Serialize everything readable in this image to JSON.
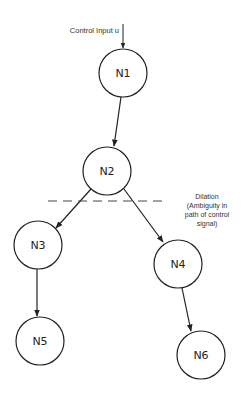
{
  "diagram": {
    "input_label": "Control Input u",
    "nodes": [
      {
        "id": "N1",
        "label": "N1",
        "cx": 123,
        "cy": 73
      },
      {
        "id": "N2",
        "label": "N2",
        "cx": 107,
        "cy": 171
      },
      {
        "id": "N3",
        "label": "N3",
        "cx": 38,
        "cy": 245
      },
      {
        "id": "N4",
        "label": "N4",
        "cx": 178,
        "cy": 264
      },
      {
        "id": "N5",
        "label": "N5",
        "cx": 40,
        "cy": 341
      },
      {
        "id": "N6",
        "label": "N6",
        "cx": 201,
        "cy": 355
      }
    ],
    "edges": [
      {
        "from": "N1",
        "to": "N2"
      },
      {
        "from": "N2",
        "to": "N3"
      },
      {
        "from": "N2",
        "to": "N4"
      },
      {
        "from": "N3",
        "to": "N5"
      },
      {
        "from": "N4",
        "to": "N6"
      }
    ],
    "dilation_note": {
      "line1": "Dilation",
      "line2": "(Ambiguity in",
      "line3": "path of control",
      "line4": "signal)"
    },
    "colors": {
      "stroke": "#222222",
      "text": "#222222",
      "background": "#ffffff"
    }
  }
}
